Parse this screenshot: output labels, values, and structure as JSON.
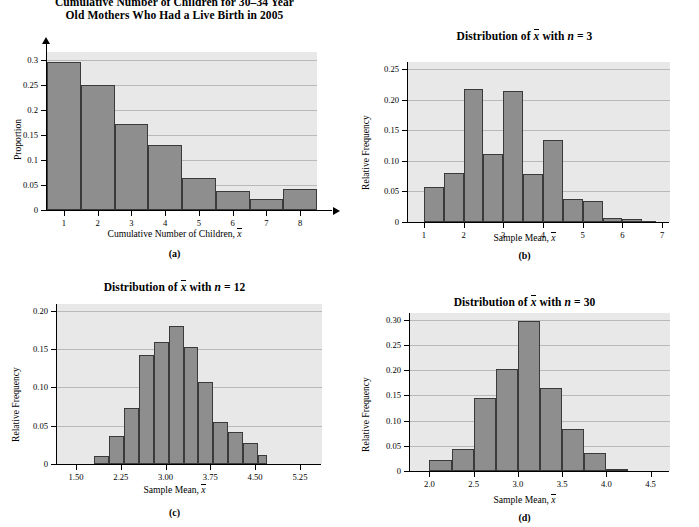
{
  "figure": {
    "panel_count": 4,
    "bar_color": "#8e8e8e",
    "plot_bg": "#e8e8e8",
    "grid_color": "#b9b9b9"
  },
  "panels": {
    "a": {
      "caption": "(a)",
      "title_line1": "Cumulative Number of Children for 30–34 Year",
      "title_line2": "Old Mothers Who Had a Live Birth in 2005",
      "xlabel_pre": "Cumulative Number of Children, ",
      "xlabel_sym": "x",
      "ylabel": "Proportion",
      "yticks": [
        "0",
        "0.05",
        "0.1",
        "0.15",
        "0.2",
        "0.25",
        "0.3"
      ],
      "xticks": [
        "1",
        "2",
        "3",
        "4",
        "5",
        "6",
        "7",
        "8"
      ]
    },
    "b": {
      "caption": "(b)",
      "title_pre": "Distribution of ",
      "title_sym": "x",
      "title_mid": " with ",
      "title_n": "n",
      "title_eq": " = 3",
      "xlabel_pre": "Sample Mean, ",
      "xlabel_sym": "x",
      "ylabel": "Relative Frequency",
      "yticks": [
        "0",
        "0.05",
        "0.10",
        "0.15",
        "0.20",
        "0.25"
      ],
      "xticks": [
        "1",
        "2",
        "3",
        "4",
        "5",
        "6",
        "7"
      ]
    },
    "c": {
      "caption": "(c)",
      "title_pre": "Distribution of ",
      "title_sym": "x",
      "title_mid": " with ",
      "title_n": "n",
      "title_eq": " = 12",
      "xlabel_pre": "Sample Mean, ",
      "xlabel_sym": "x",
      "ylabel": "Relative Frequency",
      "yticks": [
        "0",
        "0.05",
        "0.10",
        "0.15",
        "0.20"
      ],
      "xticks": [
        "1.50",
        "2.25",
        "3.00",
        "3.75",
        "4.50",
        "5.25"
      ]
    },
    "d": {
      "caption": "(d)",
      "title_pre": "Distribution of ",
      "title_sym": "x",
      "title_mid": " with ",
      "title_n": "n",
      "title_eq": " = 30",
      "xlabel_pre": "Sample Mean, ",
      "xlabel_sym": "x",
      "ylabel": "Relative Frequency",
      "yticks": [
        "0",
        "0.05",
        "0.10",
        "0.15",
        "0.20",
        "0.25",
        "0.30"
      ],
      "xticks": [
        "2.0",
        "2.5",
        "3.0",
        "3.5",
        "4.0",
        "4.5"
      ]
    }
  },
  "chart_data": [
    {
      "id": "a",
      "type": "bar",
      "title": "Cumulative Number of Children for 30–34 Year Old Mothers Who Had a Live Birth in 2005",
      "xlabel": "Cumulative Number of Children, x̄",
      "ylabel": "Proportion",
      "categories": [
        "1",
        "2",
        "3",
        "4",
        "5",
        "6",
        "7",
        "8"
      ],
      "values": [
        0.295,
        0.25,
        0.172,
        0.129,
        0.064,
        0.037,
        0.022,
        0.042
      ],
      "xlim": [
        0.5,
        8.5
      ],
      "ylim": [
        0,
        0.315
      ],
      "yticks": [
        0,
        0.05,
        0.1,
        0.15,
        0.2,
        0.25,
        0.3
      ],
      "xticks": [
        1,
        2,
        3,
        4,
        5,
        6,
        7,
        8
      ],
      "bin_width": 1,
      "grid": true,
      "legend": null
    },
    {
      "id": "b",
      "type": "bar",
      "title": "Distribution of x̄ with n = 3",
      "xlabel": "Sample Mean, x̄",
      "ylabel": "Relative Frequency",
      "bin_edges": [
        1.0,
        1.5,
        2.0,
        2.5,
        3.0,
        3.5,
        4.0,
        4.5,
        5.0,
        5.5,
        6.0,
        6.5,
        6.85
      ],
      "values": [
        0.058,
        0.081,
        0.217,
        0.112,
        0.214,
        0.079,
        0.134,
        0.038,
        0.034,
        0.007,
        0.005,
        0.002
      ],
      "xlim": [
        0.6,
        7.2
      ],
      "ylim": [
        0,
        0.262
      ],
      "yticks": [
        0,
        0.05,
        0.1,
        0.15,
        0.2,
        0.25
      ],
      "xticks": [
        1,
        2,
        3,
        4,
        5,
        6,
        7
      ],
      "grid": true,
      "legend": null
    },
    {
      "id": "c",
      "type": "bar",
      "title": "Distribution of x̄ with n = 12",
      "xlabel": "Sample Mean, x̄",
      "ylabel": "Relative Frequency",
      "bin_edges": [
        1.8,
        2.05,
        2.3,
        2.55,
        2.8,
        3.05,
        3.3,
        3.55,
        3.8,
        4.05,
        4.3,
        4.55,
        4.7
      ],
      "values": [
        0.01,
        0.037,
        0.073,
        0.142,
        0.159,
        0.18,
        0.153,
        0.107,
        0.055,
        0.042,
        0.027,
        0.012
      ],
      "xlim": [
        1.18,
        5.62
      ],
      "ylim": [
        0,
        0.209
      ],
      "yticks": [
        0,
        0.05,
        0.1,
        0.15,
        0.2
      ],
      "xticks": [
        1.5,
        2.25,
        3.0,
        3.75,
        4.5,
        5.25
      ],
      "grid": true,
      "legend": null
    },
    {
      "id": "d",
      "type": "bar",
      "title": "Distribution of x̄ with n = 30",
      "xlabel": "Sample Mean, x̄",
      "ylabel": "Relative Frequency",
      "bin_edges": [
        2.0,
        2.25,
        2.5,
        2.75,
        3.0,
        3.25,
        3.5,
        3.75,
        4.0,
        4.25
      ],
      "values": [
        0.021,
        0.043,
        0.144,
        0.203,
        0.297,
        0.165,
        0.083,
        0.035,
        0.003
      ],
      "xlim": [
        1.78,
        4.72
      ],
      "ylim": [
        0,
        0.313
      ],
      "yticks": [
        0,
        0.05,
        0.1,
        0.15,
        0.2,
        0.25,
        0.3
      ],
      "xticks": [
        2.0,
        2.5,
        3.0,
        3.5,
        4.0,
        4.5
      ],
      "grid": true,
      "legend": null
    }
  ]
}
